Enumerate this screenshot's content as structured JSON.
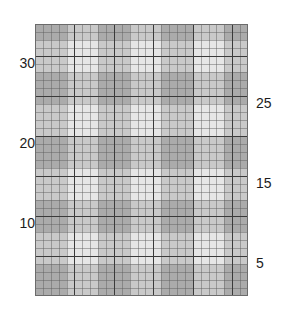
{
  "chart_data": {
    "type": "heatmap",
    "title": "",
    "subtitle": "",
    "xlabel": "",
    "ylabel": "",
    "grid": true,
    "legend_position": "none",
    "columns": 27,
    "rows": 34,
    "row_axis_labels_left": [
      {
        "value": "30",
        "row_from_bottom": 30
      },
      {
        "value": "20",
        "row_from_bottom": 20
      },
      {
        "value": "10",
        "row_from_bottom": 10
      }
    ],
    "row_axis_labels_right": [
      {
        "value": "25",
        "row_from_bottom": 25
      },
      {
        "value": "15",
        "row_from_bottom": 15
      },
      {
        "value": "5",
        "row_from_bottom": 5
      }
    ],
    "tick_labels": [
      "30",
      "25",
      "20",
      "15",
      "10",
      "5"
    ],
    "ylim": [
      1,
      34
    ],
    "emphasis_line_interval": 5,
    "shade_levels": {
      "light": "#e6e6e6",
      "medium": "#c9c9c9",
      "dark": "#ababab"
    },
    "band_period": 8,
    "band_light_cells": 4,
    "band_dark_cells": 4,
    "column_band_pattern": [
      "dark",
      "dark",
      "dark",
      "dark",
      "light",
      "light",
      "light",
      "light"
    ],
    "row_band_pattern": [
      "dark",
      "dark",
      "dark",
      "dark",
      "light",
      "light",
      "light",
      "light"
    ],
    "column_band_offset": 0,
    "row_band_offset": 2
  },
  "axis": {
    "left_labels": [
      "30",
      "20",
      "10"
    ],
    "right_labels": [
      "25",
      "15",
      "5"
    ]
  },
  "colors": {
    "background": "#ffffff",
    "text": "#1c1c1c",
    "fine_gridline": "#5a5a5a",
    "bold_gridline": "#3a3a3a",
    "border": "#6b6b6b",
    "shade_light": "#e6e6e6",
    "shade_medium": "#c9c9c9",
    "shade_dark": "#ababab"
  }
}
